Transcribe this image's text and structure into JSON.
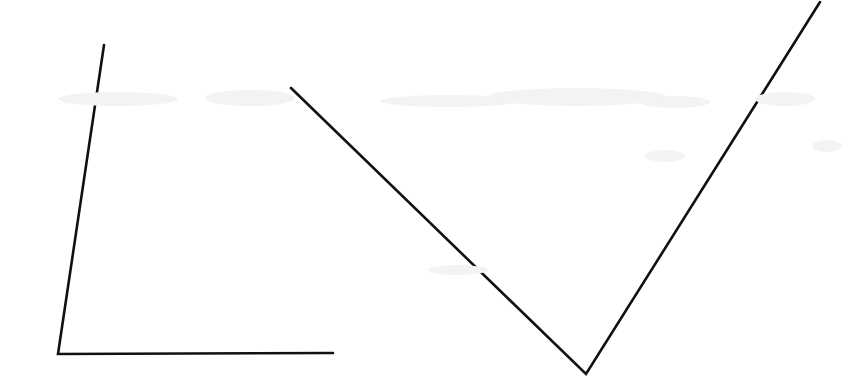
{
  "document": {
    "kind": "scanned-geometry-worksheet",
    "title": "Two Angles",
    "page_width": 858,
    "page_height": 389,
    "background_color": "#ffffff",
    "ink_color": "#111111",
    "paper_noise_color": "#f3f3f3"
  },
  "chart_data": {
    "type": "line",
    "xlabel": "",
    "ylabel": "",
    "xlim": [
      0,
      858
    ],
    "ylim": [
      389,
      0
    ],
    "grid": false,
    "legend": "none",
    "stroke_color": "#111111",
    "stroke_width": 2.6,
    "series": [
      {
        "name": "left-angle",
        "shape": "L-shaped acute angle opening up-right",
        "vertex": [
          58,
          354
        ],
        "points": [
          [
            104,
            45
          ],
          [
            58,
            354
          ],
          [
            333,
            353
          ]
        ],
        "rays": [
          {
            "name": "left-angle-ray-up",
            "from": [
              58,
              354
            ],
            "to": [
              104,
              45
            ]
          },
          {
            "name": "left-angle-ray-right",
            "from": [
              58,
              354
            ],
            "to": [
              333,
              353
            ]
          }
        ]
      },
      {
        "name": "right-angle-v",
        "shape": "V-shaped acute angle opening upward",
        "vertex": [
          586,
          374
        ],
        "points": [
          [
            291,
            88
          ],
          [
            586,
            374
          ],
          [
            820,
            2
          ]
        ],
        "rays": [
          {
            "name": "v-ray-left",
            "from": [
              586,
              374
            ],
            "to": [
              291,
              88
            ]
          },
          {
            "name": "v-ray-right",
            "from": [
              586,
              374
            ],
            "to": [
              820,
              2
            ]
          }
        ]
      }
    ],
    "annotations": []
  },
  "noise_marks": [
    {
      "x": 58,
      "y": 92,
      "w": 120,
      "h": 14
    },
    {
      "x": 205,
      "y": 90,
      "w": 90,
      "h": 16
    },
    {
      "x": 380,
      "y": 95,
      "w": 140,
      "h": 12
    },
    {
      "x": 487,
      "y": 88,
      "w": 180,
      "h": 18
    },
    {
      "x": 640,
      "y": 96,
      "w": 70,
      "h": 12
    },
    {
      "x": 755,
      "y": 92,
      "w": 60,
      "h": 14
    },
    {
      "x": 645,
      "y": 150,
      "w": 40,
      "h": 12
    },
    {
      "x": 428,
      "y": 265,
      "w": 60,
      "h": 10
    },
    {
      "x": 812,
      "y": 140,
      "w": 30,
      "h": 12
    }
  ]
}
